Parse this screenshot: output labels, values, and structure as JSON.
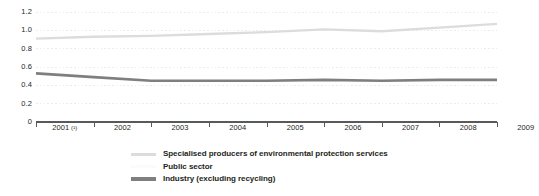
{
  "chart_data": {
    "type": "line",
    "title": "",
    "subtitle": "",
    "xlabel": "",
    "ylabel": "",
    "x": [
      "2001 (¹)",
      "2002",
      "2003",
      "2004",
      "2005",
      "2006",
      "2007",
      "2008",
      "2009"
    ],
    "x_plain": [
      "2001",
      "2002",
      "2003",
      "2004",
      "2005",
      "2006",
      "2007",
      "2008",
      "2009"
    ],
    "xlim": [
      2001,
      2009
    ],
    "ylim": [
      0,
      1.2
    ],
    "yticks": [
      0,
      0.2,
      0.4,
      0.6,
      0.8,
      1.0,
      1.2
    ],
    "ytick_labels": [
      "0",
      "0.2",
      "0.4",
      "0.6",
      "0.8",
      "1.0",
      "1.2"
    ],
    "grid": true,
    "grid_style": "dotted",
    "legend_position": "bottom",
    "series": [
      {
        "name": "Specialised producers of environmental protection services",
        "color": "#dcdcdc",
        "width": 2.4,
        "values": [
          0.91,
          0.93,
          0.94,
          0.96,
          0.98,
          1.01,
          0.99,
          1.03,
          1.07
        ]
      },
      {
        "name": "Public sector",
        "color": "#fbfbfb",
        "width": 2.4,
        "values": [
          null,
          null,
          null,
          null,
          null,
          null,
          null,
          null,
          null
        ]
      },
      {
        "name": "Industry (excluding recycling)",
        "color": "#7f7f7f",
        "width": 2.6,
        "values": [
          0.53,
          0.49,
          0.45,
          0.45,
          0.45,
          0.46,
          0.45,
          0.46,
          0.46
        ]
      }
    ]
  },
  "axis": {
    "y_labels": [
      "1.2",
      "1.0",
      "0.8",
      "0.6",
      "0.4",
      "0.2",
      "0"
    ],
    "x_labels": [
      {
        "year": "2001",
        "footnote": "(¹)"
      },
      {
        "year": "2002",
        "footnote": ""
      },
      {
        "year": "2003",
        "footnote": ""
      },
      {
        "year": "2004",
        "footnote": ""
      },
      {
        "year": "2005",
        "footnote": ""
      },
      {
        "year": "2006",
        "footnote": ""
      },
      {
        "year": "2007",
        "footnote": ""
      },
      {
        "year": "2008",
        "footnote": ""
      },
      {
        "year": "2009",
        "footnote": ""
      }
    ]
  },
  "legend": {
    "items": [
      {
        "label": "Specialised producers of environmental protection services",
        "color": "#dcdcdc"
      },
      {
        "label": "Public sector",
        "color": "#fbfbfb"
      },
      {
        "label": "Industry (excluding recycling)",
        "color": "#7f7f7f"
      }
    ]
  },
  "colors": {
    "axis": "#58595b",
    "grid": "#ebebeb",
    "text": "#231f20",
    "background": "#ffffff"
  }
}
